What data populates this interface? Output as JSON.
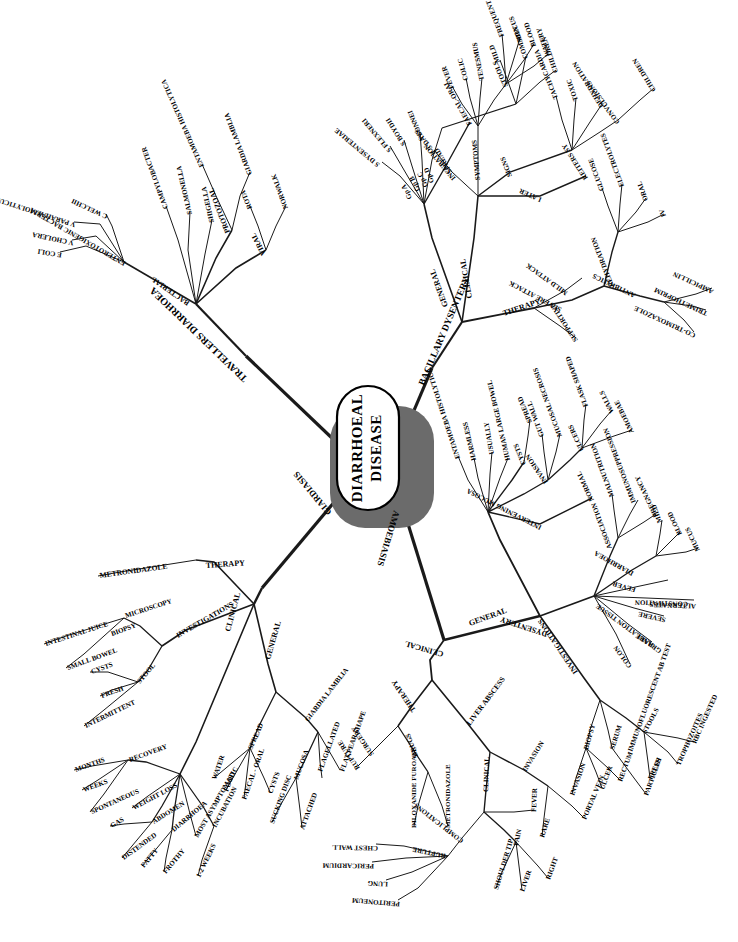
{
  "diagram": {
    "type": "mind-map",
    "title": "DIARRHOEAL DISEASE",
    "center": {
      "line1": "DIARRHOEAL",
      "line2": "DISEASE"
    },
    "main_branches": [
      "TRAVELLERS DIARRHOEA",
      "BACILLARY DYSENTERY",
      "AMOEBIASIS",
      "GIARDIASIS"
    ],
    "colors": {
      "ink": "#000000",
      "shadow": "#6b6b6b",
      "background": "#ffffff"
    }
  },
  "labels": {
    "center_l1": "DIARRHOEAL",
    "center_l2": "DISEASE",
    "b_travellers": "TRAVELLERS DIARRHOEA",
    "b_bacillary": "BACILLARY DYSENTERY",
    "b_amoebiasis": "AMOEBIASIS",
    "b_giardiasis": "GIARDIASIS",
    "td_bacterial": "BACTERIAL",
    "td_enterotox": "ENTEROTOXIGENIC BACTERIA",
    "td_ecoli": "E COLI",
    "td_vcholera": "V CHOLERA",
    "td_vpara": "V PARAHAEMOLYTICUS",
    "td_cwelchii": "C WELCHII",
    "td_campylo": "CAMPYLOBACTER",
    "td_salmonella": "SALMONELLA",
    "td_shigella": "SHIGELLA",
    "td_protozoal": "PROTOZOAL",
    "td_entamoeba": "ENTAMOEBA HISTOLYTICA",
    "td_giardia": "GIARDIA LAMBLIA",
    "td_viral": "VIRAL",
    "td_rota": "ROTA",
    "td_norwalk": "NORWALK",
    "bd_general": "GENERAL",
    "bd_gpa": "Gp A",
    "bd_sdysenteriae": "S DYSENTERIAE",
    "bd_gpb": "Gp B",
    "bd_sflexneri": "S FLEXNERI",
    "bd_gpc": "Gp C",
    "bd_sboydii": "S BOYDII",
    "bd_gpd": "Gp D",
    "bd_ssonnei": "S SONNEI",
    "bd_mild": "MILD",
    "bd_common": "COMMON",
    "bd_children": "CHILDREN",
    "bd_spread": "SPREAD",
    "bd_faecaloral": "FAECAL-ORAL",
    "bd_clinical": "CLINICAL",
    "bd_incubation": "INCUBATION",
    "bd_13days": "1-3 DAYS",
    "bd_symptoms": "SYMPTOMS",
    "bd_fever": "FEVER",
    "bd_colic": "COLIC",
    "bd_tenesmus": "TENESMUS",
    "bd_stools": "STOOLS",
    "bd_frequent": "FREQUENT",
    "bd_mucus": "MUCUS",
    "bd_blood": "BLOOD",
    "bd_watery": "WATERY",
    "bd_signs": "SIGNS",
    "bd_tachycardia": "TACHYCARDIA",
    "bd_toxic": "TOXIC",
    "bd_dehydration": "DEHYDRATION",
    "bd_convulsions": "CONVULSIONS",
    "bd_children2": "CHILDREN",
    "bd_later": "LATER",
    "bd_reiters": "REITERS SY",
    "bd_therapy": "THERAPY",
    "bd_mildattack": "MILD ATTACK",
    "bd_severeattack": "SEVERE ATTACK",
    "bd_supportive": "SUPPORTIVE",
    "bd_rehydration": "REHYDRATION",
    "bd_glucose": "GLUCOSE",
    "bd_electrolytes": "ELECTROLYTES",
    "bd_oral": "ORAL",
    "bd_iv": "IV",
    "bd_antibiotics": "ANTIBIOTICS",
    "bd_cotrimoxazole": "CO-TRIMOXAZOLE",
    "bd_trimethoprim": "TRIMETHOPRIM",
    "bd_ampicillin": "AMPICILLIN",
    "am_general": "GENERAL",
    "am_entamoeba": "ENTAMOEBA HISTOLYTICA",
    "am_harmless": "HARMLESS",
    "am_usually": "USUALLY",
    "am_humanbowel": "HUMAN LARGE BOWEL",
    "am_cysts": "CYSTS",
    "am_spread": "SPREAD",
    "am_faecaloral": "FAECAL-ORAL",
    "am_invasion": "INVASION",
    "am_gutwall": "GUT WALL",
    "am_mucosalnecrosis": "MUCOSAL NECROSIS",
    "am_ulcers": "ULCERS",
    "am_flask": "FLASK SHAPED",
    "am_walls": "WALLS",
    "am_amoebae": "AMOEBAE",
    "am_intervening": "INTERVENING MUCOSA",
    "am_normal": "NORMAL",
    "am_dysentery": "DYSENTERY",
    "am_association": "ASSOCIATION",
    "am_malnutrition": "MALNUTRITION",
    "am_immunosup": "IMMUNOSUPPRESSION",
    "am_pregnancy": "PREGNANCY",
    "am_diarrhoea": "DIARRHOEA",
    "am_mild": "MILD",
    "am_blood": "BLOOD",
    "am_mucus": "MUCUS",
    "am_fever": "FEVER",
    "am_constipation": "CONSTIPATION",
    "am_alternates": "ALTERNATES",
    "am_severe": "SEVERE",
    "am_rare": "RARE",
    "am_colon": "COLON",
    "am_granulation": "GRANULATION TISSUE",
    "am_investigations": "INVESTIGATIONS",
    "am_biopsy": "BIOPSY",
    "am_inv_invasion": "INVASION",
    "am_ulcer": "ULCER",
    "am_rectum": "RECTUM",
    "am_particles": "PARTICLES",
    "am_serum": "SERUM",
    "am_ift": "IMMUNOFLUORESCENT AB TEST",
    "am_stools": "STOOLS",
    "am_fresh": "FRESH",
    "am_trophozoites": "TROPHOZOITES",
    "am_rbc": "RBC INGESTED",
    "am_clinical": "CLINICAL",
    "am_therapy": "THERAPY",
    "am_surgery": "SURGERY",
    "am_rupture1": "RUPTURE",
    "am_drugs": "DRUGS",
    "am_diloxanide": "DILOXANIDE FUROATE",
    "am_metronidazole": "METRONIDAZOLE",
    "am_liverabscess": "LIVER ABSCESS",
    "am_la_invasion": "INVASION",
    "am_portalvein": "PORTAL VEIN",
    "am_la_rare": "RARE",
    "am_la_clinical": "CLINICAL",
    "am_complications": "COMPLICATIONS",
    "am_rupture2": "RUPTURE",
    "am_chestwall": "CHEST WALL",
    "am_pericardium": "PERICARDIUM",
    "am_lung": "LUNG",
    "am_peritoneum": "PERITONEUM",
    "am_pain": "PAIN",
    "am_shouldertip": "SHOULDER TIP",
    "am_liver": "LIVER",
    "am_right": "RIGHT",
    "am_la_fever": "FEVER",
    "gi_therapy": "THERAPY",
    "gi_metronidazole": "METRONIDAZOLE",
    "gi_investigations": "INVESTIGATIONS",
    "gi_microscopy": "MICROSCOPY",
    "gi_intestinaljuice": "INTESTINAL JUICE",
    "gi_smallbowel": "SMALL BOWEL",
    "gi_biopsy": "BIOPSY",
    "gi_stool": "STOOL",
    "gi_cysts": "CYSTS",
    "gi_fresh": "FRESH",
    "gi_intermittent": "INTERMITTENT",
    "gi_clinical": "CLINICAL",
    "gi_recovery": "RECOVERY",
    "gi_months": "MONTHS",
    "gi_weeks": "WEEKS",
    "gi_spontaneous": "SPONTANEOUS",
    "gi_weightloss": "WEIGHT LOSS",
    "gi_abdomen": "ABDOMEN",
    "gi_gas": "GAS",
    "gi_distended": "DISTENDED",
    "gi_diarrhoea": "DIARRHOEA",
    "gi_fatty": "FATTY",
    "gi_frothy": "FROTHY",
    "gi_asymptomatic": "MOST ASYMPTOMATIC",
    "gi_incubation": "INCUBATION",
    "gi_12weeks": "1-2 WEEKS",
    "gi_general": "GENERAL",
    "gi_spread": "SPREAD",
    "gi_water": "WATER",
    "gi_food": "FOOD",
    "gi_faecaloral": "FAECAL - ORAL",
    "gi_spreadcysts": "CYSTS",
    "gi_giardialamblia": "GIARDIA LAMBLIA",
    "gi_flagellated": "FLAGELLATED",
    "gi_flatpear": "FLAT PEAR SHAPE",
    "gi_mucosa": "MUCOSA",
    "gi_suckingdisc": "SUCKING DISC",
    "gi_attached": "ATTACHED"
  }
}
